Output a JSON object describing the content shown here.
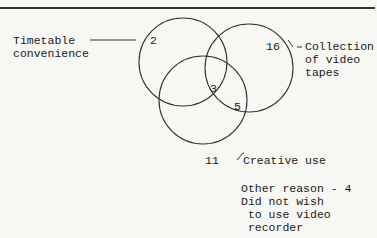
{
  "diagram": {
    "type": "venn",
    "sets": [
      {
        "label": "Timetable convenience",
        "only_count": "2"
      },
      {
        "label": "Collection of video tapes",
        "only_count": "16"
      },
      {
        "label": "Creative use",
        "only_count": "11"
      }
    ],
    "intersections": {
      "all_three": "3",
      "collection_and_creative": "5"
    },
    "labels": {
      "timetable_line1": "Timetable",
      "timetable_line2": "convenience",
      "collection_line1": "Collection",
      "collection_line2": "of video",
      "collection_line3": "tapes",
      "creative": "Creative use"
    },
    "counts": {
      "timetable_only": "2",
      "collection_only": "16",
      "creative_only": "11",
      "all_three": "3",
      "collection_creative": "5"
    },
    "notes": {
      "line1": "Other reason - 4",
      "line2": "Did not wish",
      "line3": " to use video",
      "line4": " recorder",
      "line5": " more",
      "line6": " extensively - 27"
    },
    "colors": {
      "line": "#333333",
      "background": "#f7f7f4"
    }
  }
}
